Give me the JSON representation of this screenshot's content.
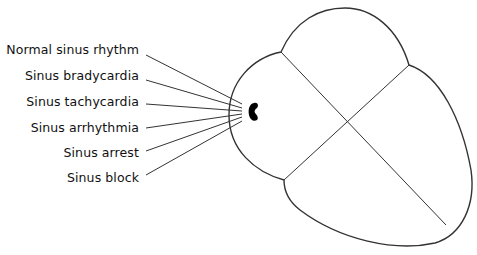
{
  "diagram": {
    "labels": [
      {
        "text": "Normal sinus rhythm",
        "y": 43
      },
      {
        "text": "Sinus bradycardia",
        "y": 69
      },
      {
        "text": "Sinus tachycardia",
        "y": 95
      },
      {
        "text": "Sinus arrhythmia",
        "y": 121
      },
      {
        "text": "Sinus arrest",
        "y": 146
      },
      {
        "text": "Sinus block",
        "y": 171
      }
    ],
    "colors": {
      "stroke": "#333333",
      "node": "#000000",
      "text": "#111111",
      "background": "#ffffff"
    }
  }
}
